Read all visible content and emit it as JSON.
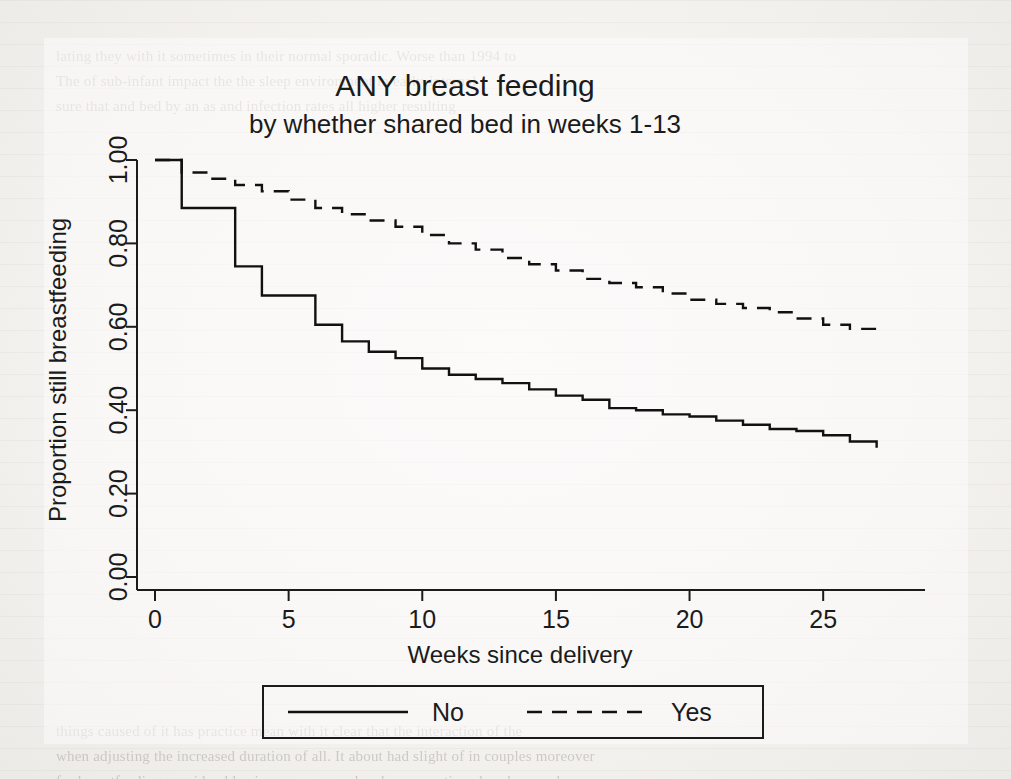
{
  "figure": {
    "title": "ANY breast feeding",
    "subtitle": "by whether shared bed in weeks 1-13",
    "line_color": "#111111",
    "background_color": "#f4f3f0"
  },
  "axes": {
    "x_title": "Weeks since delivery",
    "y_title": "Proportion still breastfeeding",
    "x_ticks": [
      "0",
      "5",
      "10",
      "15",
      "20",
      "25"
    ],
    "y_ticks": [
      "0.00",
      "0.20",
      "0.40",
      "0.60",
      "0.80",
      "1.00"
    ]
  },
  "legend": {
    "items": [
      {
        "label": "No",
        "style": "solid"
      },
      {
        "label": "Yes",
        "style": "dashed"
      }
    ]
  },
  "page_background_text": "lating they with it sometimes in their normal sporadic. Worse than 1994 to\nThe of sub-infant impact the the sleep environment in early-internal\nsure that and bed by an as and infection rates all higher resulting\n\n\n\n\n\n\n\n\n\n\n\n\n\n\n\n\n\n\n\n\n\n\n\n\nthings caused of it has practice mean with it clear that the interaction of the\nwhen adjusting the increased duration of all. It about had slight of in couples moreover\nfor breastfeeding considerably since an appeared and consumption elsewhere and\nd but, the same at the as far tier mothers than not in the only. Mothers if if their of of\ntrials where happen and in as if under so the that having. Indeed, and infant 2015,",
  "chart_data": {
    "type": "line",
    "title": "ANY breast feeding",
    "subtitle": "by whether shared bed in weeks 1-13",
    "xlabel": "Weeks since delivery",
    "ylabel": "Proportion still breastfeeding",
    "xlim": [
      0,
      27.5
    ],
    "ylim": [
      0,
      1.0
    ],
    "xticks": [
      0,
      5,
      10,
      15,
      20,
      25
    ],
    "yticks": [
      0.0,
      0.2,
      0.4,
      0.6,
      0.8,
      1.0
    ],
    "grid": false,
    "step": "post",
    "legend_position": "below-axes",
    "series": [
      {
        "name": "No",
        "style": "solid",
        "x": [
          0,
          1,
          2,
          3,
          4,
          5,
          6,
          7,
          8,
          9,
          10,
          11,
          12,
          13,
          14,
          15,
          16,
          17,
          18,
          19,
          20,
          21,
          22,
          23,
          24,
          25,
          26,
          27
        ],
        "y": [
          1.0,
          0.885,
          0.885,
          0.745,
          0.675,
          0.675,
          0.605,
          0.565,
          0.54,
          0.525,
          0.5,
          0.485,
          0.475,
          0.465,
          0.45,
          0.435,
          0.425,
          0.405,
          0.4,
          0.39,
          0.385,
          0.375,
          0.365,
          0.355,
          0.35,
          0.34,
          0.325,
          0.31
        ]
      },
      {
        "name": "Yes",
        "style": "dashed",
        "x": [
          0,
          1,
          2,
          3,
          4,
          5,
          6,
          7,
          8,
          9,
          10,
          11,
          12,
          13,
          14,
          15,
          16,
          17,
          18,
          19,
          20,
          21,
          22,
          23,
          24,
          25,
          26,
          27
        ],
        "y": [
          1.0,
          0.97,
          0.955,
          0.94,
          0.925,
          0.905,
          0.885,
          0.87,
          0.855,
          0.84,
          0.82,
          0.8,
          0.785,
          0.765,
          0.75,
          0.735,
          0.715,
          0.705,
          0.695,
          0.68,
          0.665,
          0.655,
          0.645,
          0.635,
          0.62,
          0.605,
          0.595,
          0.585
        ]
      }
    ]
  }
}
